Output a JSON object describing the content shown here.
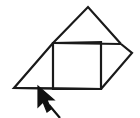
{
  "figure": {
    "name": "net-of-solid-with-pointer",
    "background_color": "#ffffff",
    "stroke_color": "#1a1a1a",
    "stroke_width": 2.2,
    "canvas": {
      "width": 140,
      "height": 118
    },
    "parts": [
      {
        "name": "square-face",
        "type": "polygon",
        "points": "53,43 101,42 101,89 53,89"
      },
      {
        "name": "top-triangle-face",
        "type": "polyline",
        "points": "53,43 88,7 121,44"
      },
      {
        "name": "top-edge-line",
        "type": "line",
        "points": "53,43 121,44"
      },
      {
        "name": "left-triangle-face",
        "type": "polyline",
        "points": "53,43 14,88 101,89"
      },
      {
        "name": "bottom-base-line",
        "type": "line",
        "points": "14,88 102,89"
      },
      {
        "name": "right-triangle-face",
        "type": "polyline",
        "points": "121,44 132,53 101,89"
      }
    ],
    "vertices": {
      "apex_top": [
        88,
        7
      ],
      "square_top_left": [
        53,
        43
      ],
      "square_top_right": [
        101,
        42
      ],
      "square_bottom_left": [
        53,
        89
      ],
      "square_bottom_right": [
        101,
        89
      ],
      "left_base": [
        14,
        88
      ],
      "right_point": [
        132,
        53
      ],
      "top_right_junction": [
        121,
        44
      ]
    }
  },
  "pointer": {
    "name": "mouse-cursor-arrow",
    "color": "#111111",
    "tip": [
      38,
      86
    ],
    "body_points": "38,86 38,107 43,102 47,112 51,109 47,100 54,100",
    "tail_points": "49,105 60,118"
  },
  "annotations": {
    "pointer_target": "bottom-left base edge of the net"
  }
}
